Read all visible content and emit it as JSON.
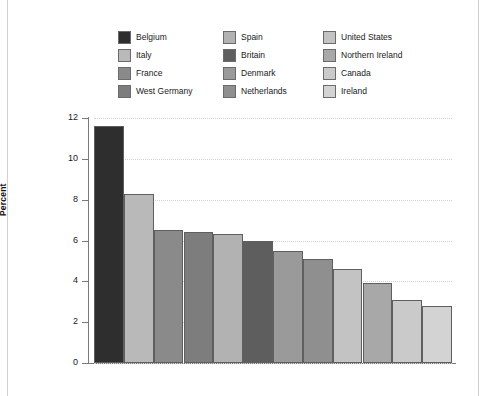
{
  "chart_data": {
    "type": "bar",
    "title": "",
    "subtitle": "",
    "xlabel": "",
    "ylabel": "Percent",
    "ylim": [
      0,
      12
    ],
    "yticks": [
      0,
      2,
      4,
      6,
      8,
      10,
      12
    ],
    "ytick_labels": [
      "0",
      "2",
      "4",
      "6",
      "8",
      "10",
      "12"
    ],
    "grid": true,
    "grid_axis": "y",
    "legend_position": "top",
    "legend_columns": 3,
    "categories": [
      "Belgium",
      "Italy",
      "France",
      "West Germany",
      "Spain",
      "Britain",
      "Denmark",
      "Netherlands",
      "United States",
      "Northern Ireland",
      "Canada",
      "Ireland"
    ],
    "values": [
      11.6,
      8.3,
      6.5,
      6.4,
      6.3,
      6.0,
      5.5,
      5.1,
      4.6,
      3.9,
      3.1,
      2.8
    ],
    "colors": [
      "#2e2e2e",
      "#b9b9b9",
      "#8a8a8a",
      "#7d7d7d",
      "#b2b2b2",
      "#5e5e5e",
      "#9a9a9a",
      "#8f8f8f",
      "#c3c3c3",
      "#a8a8a8",
      "#cacaca",
      "#d3d3d3"
    ]
  },
  "legend": {
    "columns": [
      {
        "items": [
          {
            "label": "Belgium",
            "color": "#2e2e2e"
          },
          {
            "label": "Italy",
            "color": "#b9b9b9"
          },
          {
            "label": "France",
            "color": "#8a8a8a"
          },
          {
            "label": "West Germany",
            "color": "#7d7d7d"
          }
        ]
      },
      {
        "items": [
          {
            "label": "Spain",
            "color": "#b2b2b2"
          },
          {
            "label": "Britain",
            "color": "#5e5e5e"
          },
          {
            "label": "Denmark",
            "color": "#9a9a9a"
          },
          {
            "label": "Netherlands",
            "color": "#8f8f8f"
          }
        ]
      },
      {
        "items": [
          {
            "label": "United States",
            "color": "#c3c3c3"
          },
          {
            "label": "Northern Ireland",
            "color": "#a8a8a8"
          },
          {
            "label": "Canada",
            "color": "#cacaca"
          },
          {
            "label": "Ireland",
            "color": "#d3d3d3"
          }
        ]
      }
    ]
  }
}
